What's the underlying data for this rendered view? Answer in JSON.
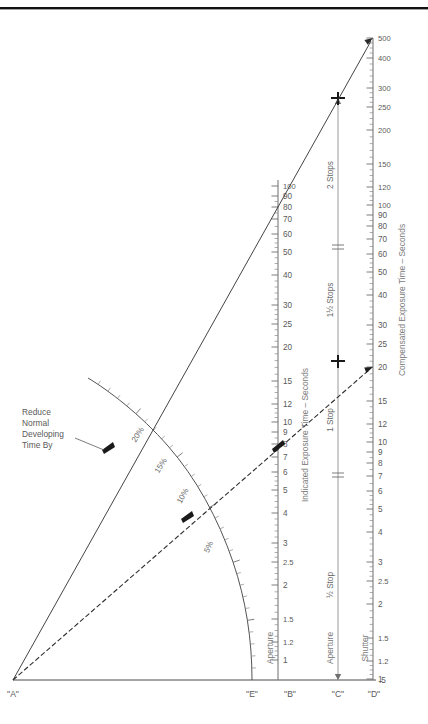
{
  "figure": {
    "top_rule": true
  },
  "chart_data": {
    "type": "line",
    "xlabel": "",
    "ylabel": "",
    "grid": false,
    "legend": "none",
    "axes": [
      {
        "id": "A",
        "label": "\"A\"",
        "role": "origin-pivot",
        "x": 13,
        "y": 680
      },
      {
        "id": "E",
        "label": "\"E\"",
        "role": "development-compensation-arc",
        "axis_title": "Reduce Normal Developing Time By",
        "ticks": [
          "20%",
          "15%",
          "10%",
          "5%"
        ],
        "tick_values": [
          20,
          15,
          10,
          5
        ]
      },
      {
        "id": "B",
        "label": "\"B\"",
        "role": "indicated-exposure",
        "axis_title": "Indicated Exposure Time – Seconds",
        "sub_label": "Aperture",
        "ticks": [
          "100",
          "90",
          "80",
          "70",
          "60",
          "50",
          "40",
          "30",
          "25",
          "20",
          "15",
          "12",
          "10",
          "9",
          "8",
          "7",
          "6",
          "5",
          "4",
          "3",
          "2.5",
          "2",
          "1.5",
          "1.2",
          "1"
        ],
        "range": [
          1,
          100
        ],
        "scale": "log"
      },
      {
        "id": "C",
        "label": "\"C\"",
        "role": "stop-compensation",
        "sub_label": "Aperture",
        "stops": [
          "2 Stops",
          "1½ Stops",
          "1 Stop",
          "½ Stop"
        ]
      },
      {
        "id": "D",
        "label": "\"D\"",
        "role": "compensated-exposure",
        "axis_title": "Compensated Exposure Time – Seconds",
        "sub_label": "Shutter",
        "ticks": [
          "500",
          "400",
          "300",
          "250",
          "200",
          "150",
          "120",
          "100",
          "90",
          "80",
          "70",
          "60",
          "50",
          "40",
          "30",
          "25",
          "20",
          "15",
          "12",
          "10",
          "9",
          "8",
          "7",
          "6",
          "5",
          "4",
          "3",
          "2.5",
          "2",
          "1.5",
          "1.2",
          "1",
          ".5"
        ],
        "range": [
          0.5,
          500
        ],
        "scale": "log"
      }
    ],
    "series": [
      {
        "name": "2-stop compensation ray",
        "style": "solid",
        "arrow": true,
        "from_axis": "A",
        "points": [
          {
            "axis": "A",
            "value": 0
          },
          {
            "axis": "B",
            "value": 100
          },
          {
            "axis": "C",
            "value": 250
          },
          {
            "axis": "D",
            "value": 500
          }
        ]
      },
      {
        "name": "1-stop compensation ray",
        "style": "dashed",
        "arrow": true,
        "from_axis": "A",
        "points": [
          {
            "axis": "E",
            "value": 10
          },
          {
            "axis": "B",
            "value": 8
          },
          {
            "axis": "C",
            "value": 13
          },
          {
            "axis": "D",
            "value": 20
          }
        ]
      }
    ],
    "markers": [
      {
        "axis": "C",
        "label": "2 Stops",
        "value": 250
      },
      {
        "axis": "C",
        "label": "1½ Stops",
        "value": 60
      },
      {
        "axis": "C",
        "label": "1 Stop",
        "value": 13
      },
      {
        "axis": "C",
        "label": "½ Stop",
        "value": 4
      },
      {
        "axis": "B",
        "value": 8
      },
      {
        "axis": "E",
        "value": 10
      },
      {
        "axis": "E",
        "value": 20
      }
    ],
    "annotations": [
      {
        "text": "Reduce Normal Developing Time By",
        "target": "E-axis 20% tick"
      }
    ]
  },
  "labels": {
    "axis_a": "\"A\"",
    "axis_e": "\"E\"",
    "axis_b": "\"B\"",
    "axis_c": "\"C\"",
    "axis_d": "\"D\"",
    "aperture_b": "Aperture",
    "aperture_c": "Aperture",
    "shutter_d": "Shutter",
    "indicated_exposure": "Indicated Exposure Time – Seconds",
    "compensated_exposure": "Compensated Exposure Time – Seconds",
    "note_line1": "Reduce",
    "note_line2": "Normal",
    "note_line3": "Developing",
    "note_line4": "Time By",
    "stop_2": "2 Stops",
    "stop_1_5": "1½ Stops",
    "stop_1": "1 Stop",
    "stop_half": "½ Stop",
    "pct_20": "20%",
    "pct_15": "15%",
    "pct_10": "10%",
    "pct_5": "5%"
  },
  "scale_b_ticks": [
    {
      "t": "100",
      "y": 186,
      "major": true
    },
    {
      "t": "90",
      "y": 196,
      "major": true
    },
    {
      "t": "80",
      "y": 207,
      "major": true
    },
    {
      "t": "70",
      "y": 219,
      "major": true
    },
    {
      "t": "60",
      "y": 234,
      "major": true
    },
    {
      "t": "50",
      "y": 252,
      "major": true
    },
    {
      "t": "40",
      "y": 275,
      "major": true
    },
    {
      "t": "30",
      "y": 305,
      "major": true
    },
    {
      "t": "25",
      "y": 324,
      "major": true
    },
    {
      "t": "20",
      "y": 347,
      "major": true
    },
    {
      "t": "15",
      "y": 381,
      "major": true
    },
    {
      "t": "12",
      "y": 404,
      "major": true
    },
    {
      "t": "10",
      "y": 422,
      "major": true
    },
    {
      "t": "9",
      "y": 432,
      "major": true
    },
    {
      "t": "8",
      "y": 444,
      "major": true
    },
    {
      "t": "7",
      "y": 457,
      "major": true
    },
    {
      "t": "6",
      "y": 472,
      "major": true
    },
    {
      "t": "5",
      "y": 490,
      "major": true
    },
    {
      "t": "4",
      "y": 513,
      "major": true
    },
    {
      "t": "3",
      "y": 543,
      "major": true
    },
    {
      "t": "2.5",
      "y": 562,
      "major": true
    },
    {
      "t": "2",
      "y": 585,
      "major": true
    },
    {
      "t": "1.5",
      "y": 619,
      "major": true
    },
    {
      "t": "1.2",
      "y": 642,
      "major": true
    },
    {
      "t": "1",
      "y": 660,
      "major": true
    }
  ],
  "scale_d_ticks": [
    {
      "t": "500",
      "y": 38,
      "major": true
    },
    {
      "t": "400",
      "y": 58,
      "major": true
    },
    {
      "t": "300",
      "y": 88,
      "major": true
    },
    {
      "t": "250",
      "y": 107,
      "major": true
    },
    {
      "t": "200",
      "y": 130,
      "major": true
    },
    {
      "t": "150",
      "y": 164,
      "major": true
    },
    {
      "t": "120",
      "y": 187,
      "major": true
    },
    {
      "t": "100",
      "y": 205,
      "major": true
    },
    {
      "t": "90",
      "y": 215,
      "major": true
    },
    {
      "t": "80",
      "y": 226,
      "major": true
    },
    {
      "t": "70",
      "y": 239,
      "major": true
    },
    {
      "t": "60",
      "y": 254,
      "major": true
    },
    {
      "t": "50",
      "y": 272,
      "major": true
    },
    {
      "t": "40",
      "y": 295,
      "major": true
    },
    {
      "t": "30",
      "y": 325,
      "major": true
    },
    {
      "t": "25",
      "y": 344,
      "major": true
    },
    {
      "t": "20",
      "y": 367,
      "major": true
    },
    {
      "t": "15",
      "y": 401,
      "major": true
    },
    {
      "t": "12",
      "y": 424,
      "major": true
    },
    {
      "t": "10",
      "y": 442,
      "major": true
    },
    {
      "t": "9",
      "y": 452,
      "major": true
    },
    {
      "t": "8",
      "y": 463,
      "major": true
    },
    {
      "t": "7",
      "y": 476,
      "major": true
    },
    {
      "t": "6",
      "y": 491,
      "major": true
    },
    {
      "t": "5",
      "y": 509,
      "major": true
    },
    {
      "t": "4",
      "y": 532,
      "major": true
    },
    {
      "t": "3",
      "y": 562,
      "major": true
    },
    {
      "t": "2.5",
      "y": 581,
      "major": true
    },
    {
      "t": "2",
      "y": 604,
      "major": true
    },
    {
      "t": "1.5",
      "y": 638,
      "major": true
    },
    {
      "t": "1.2",
      "y": 661,
      "major": true
    },
    {
      "t": "1",
      "y": 679,
      "major": true
    }
  ]
}
